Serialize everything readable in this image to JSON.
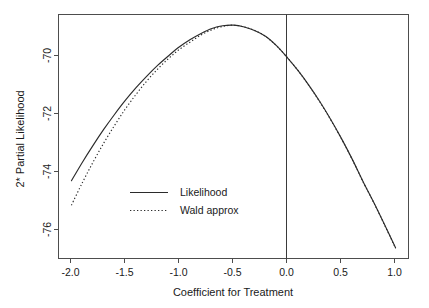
{
  "chart_data": {
    "type": "line",
    "title": "",
    "xlabel": "Coefficient for Treatment",
    "ylabel": "2* Partial Likelihood",
    "xlim": [
      -2.12,
      1.12
    ],
    "ylim": [
      -76.55,
      -68.55
    ],
    "xticks": [
      -2.0,
      -1.5,
      -1.0,
      -0.5,
      0.0,
      0.5,
      1.0
    ],
    "xtick_labels": [
      "-2.0",
      "-1.5",
      "-1.0",
      "-0.5",
      "0.0",
      "0.5",
      "1.0"
    ],
    "yticks": [
      -70,
      -72,
      -74,
      -76
    ],
    "ytick_labels": [
      "-70",
      "-72",
      "-74",
      "-76"
    ],
    "grid": false,
    "legend_position": "center-left",
    "annotations": [
      {
        "type": "vline",
        "x": 0.0,
        "label": "reference line at zero coefficient"
      }
    ],
    "series": [
      {
        "name": "Likelihood",
        "style": "solid",
        "color": "#2b2b2b",
        "x": [
          -2.0,
          -1.9,
          -1.8,
          -1.7,
          -1.6,
          -1.5,
          -1.4,
          -1.3,
          -1.2,
          -1.1,
          -1.0,
          -0.9,
          -0.8,
          -0.7,
          -0.6,
          -0.5,
          -0.4,
          -0.3,
          -0.2,
          -0.1,
          0.0,
          0.1,
          0.2,
          0.3,
          0.4,
          0.5,
          0.6,
          0.7,
          0.8,
          0.9,
          1.0
        ],
        "y": [
          -74.0,
          -73.4,
          -72.84,
          -72.31,
          -71.82,
          -71.36,
          -70.94,
          -70.56,
          -70.21,
          -69.9,
          -69.61,
          -69.37,
          -69.17,
          -69.01,
          -68.92,
          -68.9,
          -68.96,
          -69.08,
          -69.27,
          -69.58,
          -69.97,
          -70.4,
          -70.88,
          -71.41,
          -71.99,
          -72.62,
          -73.3,
          -74.03,
          -74.72,
          -75.45,
          -76.2
        ]
      },
      {
        "name": "Wald approx",
        "style": "dotted",
        "color": "#2b2b2b",
        "x": [
          -2.0,
          -1.9,
          -1.8,
          -1.7,
          -1.6,
          -1.5,
          -1.4,
          -1.3,
          -1.2,
          -1.1,
          -1.0,
          -0.9,
          -0.8,
          -0.7,
          -0.6,
          -0.5,
          -0.4,
          -0.3,
          -0.2,
          -0.1,
          0.0,
          0.1,
          0.2,
          0.3,
          0.4,
          0.5,
          0.6,
          0.7,
          0.8,
          0.9,
          1.0
        ],
        "y": [
          -74.8,
          -74.07,
          -73.39,
          -72.76,
          -72.18,
          -71.64,
          -71.16,
          -70.72,
          -70.33,
          -69.99,
          -69.69,
          -69.45,
          -69.22,
          -69.05,
          -68.94,
          -68.9,
          -68.96,
          -69.08,
          -69.28,
          -69.58,
          -69.97,
          -70.4,
          -70.89,
          -71.42,
          -72.0,
          -72.63,
          -73.31,
          -74.04,
          -74.73,
          -75.46,
          -76.21
        ]
      }
    ]
  },
  "legend": {
    "entries": [
      {
        "label": "Likelihood",
        "style": "solid"
      },
      {
        "label": "Wald approx",
        "style": "dotted"
      }
    ]
  }
}
